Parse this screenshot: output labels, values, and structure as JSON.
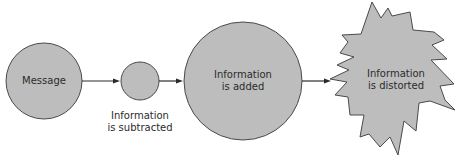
{
  "diagram": {
    "type": "flow",
    "colors": {
      "shape_fill": "#bdbdbd",
      "shape_stroke": "#4a4a4a",
      "arrow": "#2a2a2a",
      "text": "#2b2b2b",
      "background": "#ffffff"
    },
    "nodes": [
      {
        "id": "message",
        "shape": "circle",
        "lines": [
          "Message"
        ]
      },
      {
        "id": "subtracted",
        "shape": "circle",
        "lines": [
          "Information",
          "is subtracted"
        ],
        "label_position": "below"
      },
      {
        "id": "added",
        "shape": "circle",
        "lines": [
          "Information",
          "is added"
        ]
      },
      {
        "id": "distorted",
        "shape": "starburst",
        "lines": [
          "Information",
          "is distorted"
        ]
      }
    ],
    "edges": [
      {
        "from": "message",
        "to": "subtracted"
      },
      {
        "from": "subtracted",
        "to": "added"
      },
      {
        "from": "added",
        "to": "distorted"
      }
    ]
  }
}
